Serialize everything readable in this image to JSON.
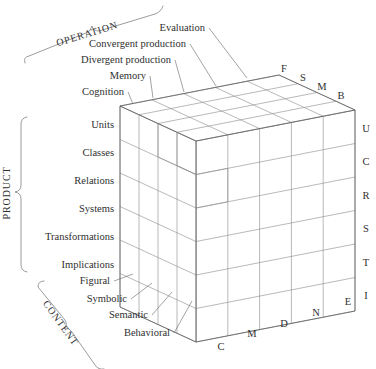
{
  "figure": {
    "line_color": "#8d8d8d",
    "edge_color": "#5f5f5f",
    "text_color": "#2f2f2f"
  },
  "axes": {
    "operation": {
      "name": "OPERATION",
      "count": 5
    },
    "product": {
      "name": "PRODUCT",
      "count": 6
    },
    "content": {
      "name": "CONTENT",
      "count": 4
    }
  },
  "operations": {
    "labels": [
      "Evaluation",
      "Convergent production",
      "Divergent production",
      "Memory",
      "Cognition"
    ],
    "letters": [
      "E",
      "N",
      "D",
      "M",
      "C"
    ]
  },
  "products": {
    "labels": [
      "Units",
      "Classes",
      "Relations",
      "Systems",
      "Transformations",
      "Implications"
    ],
    "letters": [
      "U",
      "C",
      "R",
      "S",
      "T",
      "I"
    ]
  },
  "contents": {
    "labels": [
      "Figural",
      "Symbolic",
      "Semantic",
      "Behavioral"
    ],
    "letters": [
      "F",
      "S",
      "M",
      "B"
    ]
  }
}
